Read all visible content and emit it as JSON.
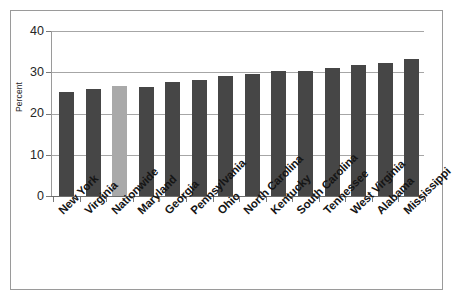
{
  "figure": {
    "background_color": "#ffffff",
    "frame_color": "#9a9a9a"
  },
  "axis": {
    "y_title": "Percent",
    "y_ticks": [
      "40",
      "30",
      "20",
      "10",
      "0"
    ]
  },
  "colors": {
    "bar_default": "#464646",
    "bar_highlight": "#a9a9a9",
    "gridline": "#a6a6a6",
    "axis": "#6e6e6e",
    "text": "#151515"
  },
  "chart_data": {
    "type": "bar",
    "title": "",
    "subtitle": "",
    "xlabel": "",
    "ylabel": "Percent",
    "ylim": [
      0,
      40
    ],
    "ytick_values": [
      0,
      10,
      20,
      30,
      40
    ],
    "grid": true,
    "legend": null,
    "orientation": "vertical",
    "highlight_category": "Nationwide",
    "categories": [
      "New York",
      "Virginia",
      "Nationwide",
      "Maryland",
      "Georgia",
      "Pennsylvania",
      "Ohio",
      "North Carolina",
      "Kentucky",
      "South Carolina",
      "Tennessee",
      "West Virginia",
      "Alabama",
      "Mississippi"
    ],
    "values": [
      25.2,
      26.0,
      26.6,
      26.4,
      27.7,
      28.2,
      29.2,
      29.5,
      30.2,
      30.4,
      31.0,
      31.7,
      32.2,
      33.3
    ]
  }
}
